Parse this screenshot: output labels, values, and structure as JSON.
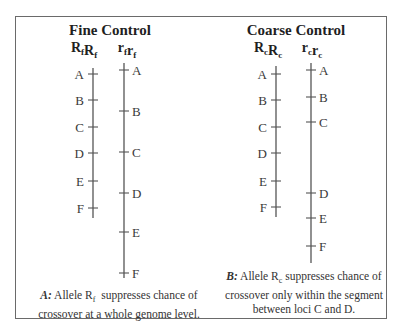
{
  "panels": [
    {
      "id": "A",
      "title": "Fine Control",
      "genotypes": [
        {
          "base": "R",
          "sub": "f",
          "label": "RfRf"
        },
        {
          "base": "r",
          "sub": "f",
          "label": "rfrf"
        }
      ],
      "loci": [
        "A",
        "B",
        "C",
        "D",
        "E",
        "F"
      ],
      "caption": {
        "letter": "A:",
        "pre": "Allele R",
        "sub": "f",
        "post": "  suppresses chance of",
        "line2": "crossover at a whole genome level."
      }
    },
    {
      "id": "B",
      "title": "Coarse Control",
      "genotypes": [
        {
          "base": "R",
          "sub": "c",
          "label": "RcRc"
        },
        {
          "base": "r",
          "sub": "c",
          "label": "rcrc"
        }
      ],
      "loci": [
        "A",
        "B",
        "C",
        "D",
        "E",
        "F"
      ],
      "caption": {
        "letter": "B:",
        "pre": "Allele R",
        "sub": "c",
        "post": " suppresses chance of",
        "line2": "crossover only within the segment",
        "line3": "between loci C and D."
      }
    }
  ]
}
